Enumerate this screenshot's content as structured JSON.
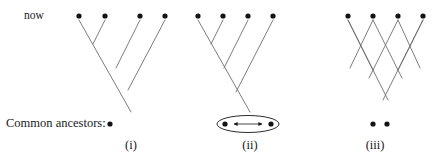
{
  "figure": {
    "time_label": "now",
    "ancestors_label": "Common ancestors:",
    "ink_color": "#6e6e6e",
    "dot_color": "#141414",
    "text_color": "#1a1a1a",
    "background": "#ffffff",
    "dot_radius": 2.6,
    "top_row_y": 16,
    "bottom_row_y": 124,
    "panels": [
      {
        "id": "panel-i",
        "roman_label": "(i)",
        "top_dots_x": [
          79,
          105,
          140,
          165
        ],
        "common_ancestor_dots_x": [
          110
        ],
        "has_ellipse": false,
        "has_double_arrow": false,
        "lineage_segments": [
          [
            79,
            20,
            131,
            112
          ],
          [
            105,
            20,
            93,
            44
          ],
          [
            140,
            20,
            116,
            68
          ],
          [
            165,
            20,
            128,
            90
          ]
        ]
      },
      {
        "id": "panel-ii",
        "roman_label": "(ii)",
        "top_dots_x": [
          198,
          223,
          248,
          273
        ],
        "common_ancestor_dots_x": [
          225,
          271
        ],
        "has_ellipse": true,
        "has_double_arrow": true,
        "ellipse": {
          "cx": 248,
          "cy": 124,
          "rx": 31,
          "ry": 8.5
        },
        "double_arrow": {
          "x1": 234,
          "x2": 262,
          "y": 124
        },
        "lineage_segments": [
          [
            198,
            20,
            250,
            112
          ],
          [
            223,
            20,
            211,
            44
          ],
          [
            248,
            20,
            224,
            68
          ],
          [
            273,
            20,
            236,
            92
          ]
        ]
      },
      {
        "id": "panel-iii",
        "roman_label": "(iii)",
        "top_dots_x": [
          348,
          373,
          398,
          423
        ],
        "common_ancestor_dots_x": [
          373,
          387
        ],
        "has_ellipse": false,
        "has_double_arrow": false,
        "lineage_segments": [
          [
            348,
            20,
            388,
            100
          ],
          [
            348,
            20,
            373,
            70
          ],
          [
            373,
            20,
            350,
            68
          ],
          [
            373,
            20,
            402,
            78
          ],
          [
            398,
            20,
            369,
            78
          ],
          [
            398,
            20,
            420,
            68
          ],
          [
            423,
            20,
            383,
            100
          ],
          [
            423,
            20,
            398,
            70
          ]
        ]
      }
    ]
  }
}
